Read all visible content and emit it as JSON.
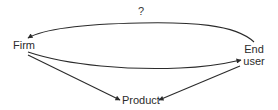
{
  "diagram": {
    "nodes": {
      "firm": {
        "label": "Firm"
      },
      "end_user": {
        "line1": "End",
        "line2": "user"
      },
      "product": {
        "label": "Product"
      }
    },
    "edges": [
      {
        "from": "End user",
        "to": "Firm",
        "label": "?",
        "style": "curved-top"
      },
      {
        "from": "Firm",
        "to": "End user",
        "label": "",
        "style": "curved-middle"
      },
      {
        "from": "Firm",
        "to": "Product",
        "label": "",
        "style": "straight"
      },
      {
        "from": "End user",
        "to": "Product",
        "label": "",
        "style": "straight"
      }
    ],
    "edge_labels": {
      "top_arc": "?"
    },
    "colors": {
      "line": "#2b2b2b",
      "text": "#2b2b2b",
      "background": "#ffffff"
    }
  }
}
